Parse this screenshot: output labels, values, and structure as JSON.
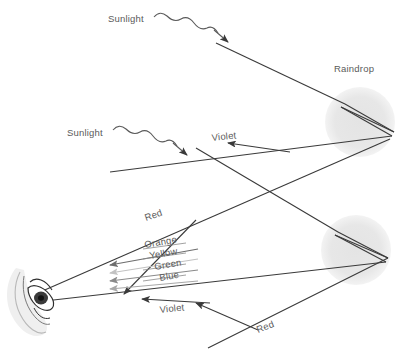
{
  "figure": {
    "background_color": "#ffffff",
    "ray_color": "#3a3a3a",
    "label_color": "#5a5a5a",
    "raindrop_fill": "#e6e6e6"
  },
  "labels": {
    "sunlight_upper": "Sunlight",
    "sunlight_lower": "Sunlight",
    "raindrop": "Raindrop",
    "violet_upper": "Violet",
    "violet_lower": "Violet",
    "red_upper": "Red",
    "red_lower": "Red",
    "orange": "Orange",
    "yellow": "Yellow",
    "green": "Green",
    "blue": "Blue"
  },
  "spectrum": {
    "order_top_to_bottom": [
      "Red",
      "Orange",
      "Yellow",
      "Green",
      "Blue",
      "Violet"
    ],
    "middle_rays": [
      {
        "name": "Orange",
        "tone": "#6e6e6e"
      },
      {
        "name": "Yellow",
        "tone": "#c2c2c2"
      },
      {
        "name": "Green",
        "tone": "#8a8a8a"
      },
      {
        "name": "Blue",
        "tone": "#a8a8a8"
      }
    ]
  },
  "raindrops": [
    {
      "id": "upper-raindrop",
      "cx": 360,
      "cy": 122,
      "r": 35
    },
    {
      "id": "lower-raindrop",
      "cx": 356,
      "cy": 250,
      "r": 35
    }
  ],
  "observer": {
    "name": "eye",
    "x": 30,
    "y": 298
  }
}
